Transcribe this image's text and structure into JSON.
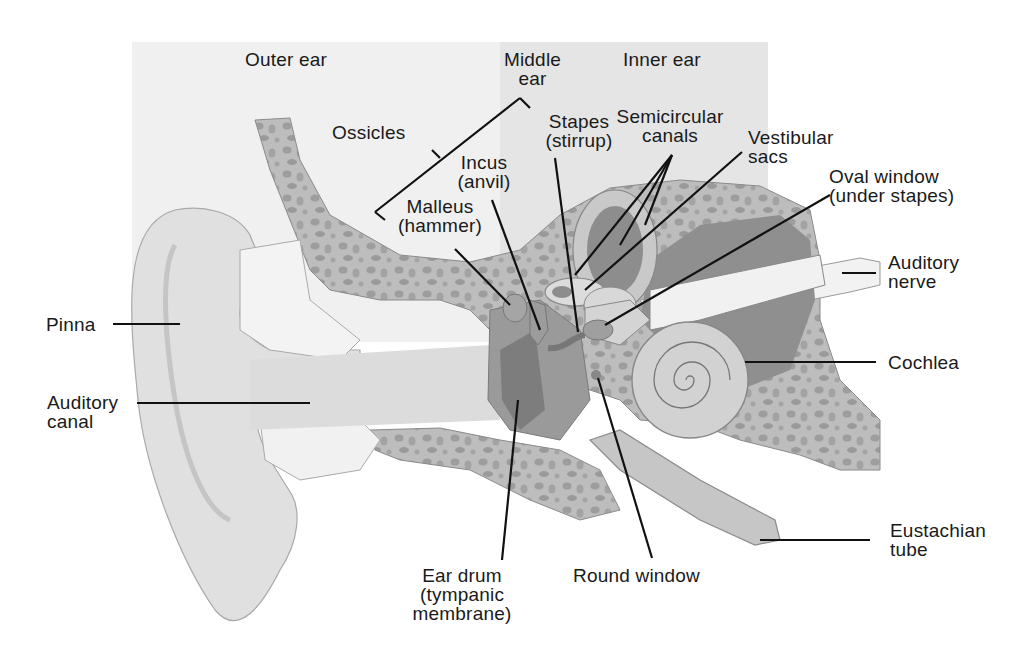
{
  "diagram": {
    "regions": {
      "outer": "Outer ear",
      "middle_1": "Middle",
      "middle_2": "ear",
      "inner": "Inner ear"
    },
    "labels": {
      "ossicles": "Ossicles",
      "stapes_1": "Stapes",
      "stapes_2": "(stirrup)",
      "incus_1": "Incus",
      "incus_2": "(anvil)",
      "malleus_1": "Malleus",
      "malleus_2": "(hammer)",
      "semicircular_1": "Semicircular",
      "semicircular_2": "canals",
      "vestibular_1": "Vestibular",
      "vestibular_2": "sacs",
      "oval_1": "Oval window",
      "oval_2": "(under stapes)",
      "auditory_nerve_1": "Auditory",
      "auditory_nerve_2": "nerve",
      "pinna": "Pinna",
      "cochlea": "Cochlea",
      "auditory_canal_1": "Auditory",
      "auditory_canal_2": "canal",
      "eustachian_1": "Eustachian",
      "eustachian_2": "tube",
      "eardrum_1": "Ear drum",
      "eardrum_2": "(tympanic",
      "eardrum_3": "membrane)",
      "round_window": "Round window"
    },
    "colors": {
      "outer_bg": "#efefef",
      "inner_bg": "#e6e6e6",
      "bone": "#b9b9b9",
      "bone_spot": "#9c9c9c",
      "skin": "#dedede",
      "cavity": "#8f8f8f",
      "cochlea": "#d6d6d6",
      "line": "#111111"
    }
  }
}
